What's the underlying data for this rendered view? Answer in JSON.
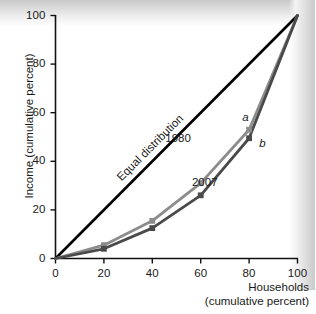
{
  "chart_data": {
    "type": "line",
    "title": "",
    "xlabel": "Households (cumulative percent)",
    "xlabel_line1": "Households",
    "xlabel_line2": "(cumulative percent)",
    "ylabel": "Income (cumulative percent)",
    "xlim": [
      0,
      100
    ],
    "ylim": [
      0,
      100
    ],
    "xticks": [
      "0",
      "20",
      "40",
      "60",
      "80",
      "100"
    ],
    "xtick_values": [
      0,
      20,
      40,
      60,
      80,
      100
    ],
    "yticks": [
      "0",
      "20",
      "40",
      "60",
      "80",
      "100"
    ],
    "ytick_values": [
      0,
      20,
      40,
      60,
      80,
      100
    ],
    "grid": false,
    "legend_position": "inline-annotations",
    "series": [
      {
        "name": "Equal distribution",
        "color": "#000000",
        "x": [
          0,
          100
        ],
        "values": [
          0,
          100
        ],
        "markers": false,
        "annotation": "Equal distribution"
      },
      {
        "name": "1980",
        "color": "#8c8c8c",
        "x": [
          0,
          20,
          40,
          60,
          80,
          100
        ],
        "values": [
          0,
          5.5,
          15.5,
          31,
          53,
          100
        ],
        "markers": true,
        "endpoint_label": "a"
      },
      {
        "name": "2007",
        "color": "#4a4a4a",
        "x": [
          0,
          20,
          40,
          60,
          80,
          100
        ],
        "values": [
          0,
          4,
          12.5,
          26,
          49.5,
          100
        ],
        "markers": true,
        "endpoint_label": "b"
      }
    ],
    "annotations": [
      {
        "text": "Equal distribution",
        "x": 28,
        "y": 36
      },
      {
        "text": "1980",
        "x": 52,
        "y": 49
      },
      {
        "text": "2007",
        "x": 63,
        "y": 31
      },
      {
        "text": "a",
        "x": 78,
        "y": 58
      },
      {
        "text": "b",
        "x": 85,
        "y": 47
      }
    ],
    "colors": {
      "equality_line": "#000000",
      "series_1980": "#8c8c8c",
      "series_2007": "#4a4a4a",
      "axis": "#111111",
      "text": "#1a1a1a",
      "background": "#ffffff"
    }
  }
}
